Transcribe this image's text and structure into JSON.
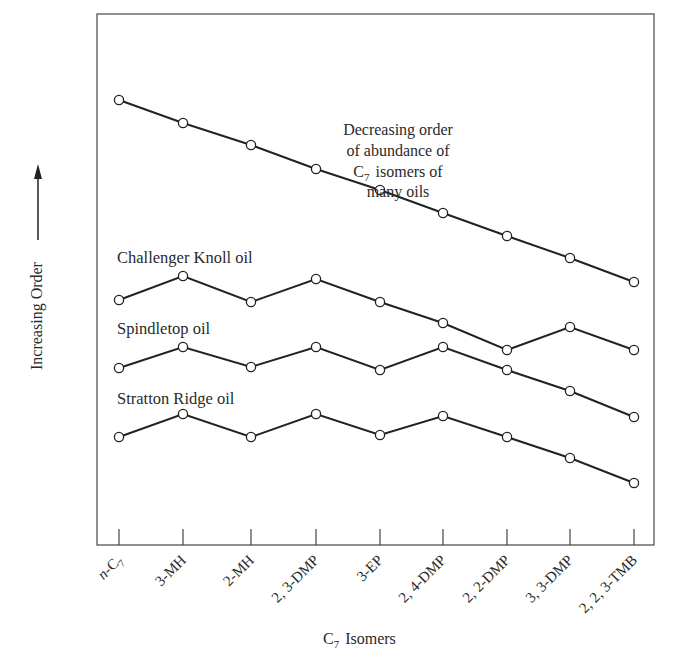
{
  "chart_data": {
    "type": "line",
    "title": "",
    "xlabel": "C7 Isomers",
    "xlabel_main": "C",
    "xlabel_sub": "7",
    "xlabel_rest": "Isomers",
    "ylabel": "Increasing Order",
    "ylabel_arrow": "up",
    "categories": [
      "n-C7",
      "3-MH",
      "2-MH",
      "2, 3-DMP",
      "3-EP",
      "2, 4-DMP",
      "2, 2-DMP",
      "3, 3-DMP",
      "2, 2, 3-TMB"
    ],
    "category_labels": [
      {
        "italic_prefix": "n",
        "text": "-C",
        "sub": "7"
      },
      {
        "italic_prefix": "",
        "text": "3-MH",
        "sub": ""
      },
      {
        "italic_prefix": "",
        "text": "2-MH",
        "sub": ""
      },
      {
        "italic_prefix": "",
        "text": "2, 3-DMP",
        "sub": ""
      },
      {
        "italic_prefix": "",
        "text": "3-EP",
        "sub": ""
      },
      {
        "italic_prefix": "",
        "text": "2, 4-DMP",
        "sub": ""
      },
      {
        "italic_prefix": "",
        "text": "2, 2-DMP",
        "sub": ""
      },
      {
        "italic_prefix": "",
        "text": "3, 3-DMP",
        "sub": ""
      },
      {
        "italic_prefix": "",
        "text": "2, 2, 3-TMB",
        "sub": ""
      }
    ],
    "y_ticks": [],
    "y_units": "relative order (no numeric scale shown); values are relative heights, higher = more abundant",
    "grid": false,
    "legend": "none (series labeled inline)",
    "series": [
      {
        "name": "Decreasing order of abundance of C7 isomers of many oils",
        "values": [
          100,
          91.2,
          82.8,
          73.6,
          65.5,
          56.7,
          47.9,
          39.5,
          30.3
        ]
      },
      {
        "name": "Challenger Knoll oil",
        "values": [
          23.4,
          32.6,
          22.6,
          31.8,
          22.6,
          14.6,
          4.2,
          13.0,
          4.2
        ]
      },
      {
        "name": "Spindletop oil",
        "values": -1
      },
      {
        "name": "Stratton Ridge oil",
        "values": -1
      }
    ]
  },
  "plot": {
    "frame": {
      "left": 97,
      "top": 14,
      "right": 654,
      "bottom": 545
    },
    "tick_x": [
      119,
      183,
      251,
      316,
      380,
      443,
      507,
      570,
      634
    ],
    "tick_height": 16,
    "series_pixels": [
      {
        "name": "decreasing-order",
        "y": [
          100,
          123,
          145,
          169,
          190,
          213,
          236,
          258,
          282
        ]
      },
      {
        "name": "challenger-knoll",
        "y": [
          300,
          276,
          302,
          279,
          302,
          323,
          350,
          327,
          350
        ]
      },
      {
        "name": "spindletop",
        "y": [
          368,
          347,
          367,
          347,
          370,
          347,
          370,
          391,
          417
        ]
      },
      {
        "name": "stratton-ridge",
        "y": [
          437,
          414,
          437,
          414,
          435,
          416,
          437,
          458,
          483
        ]
      }
    ]
  },
  "annotations": {
    "top_series": {
      "lines": [
        "Decreasing order",
        "of abundance of",
        "isomers of",
        "many oils"
      ],
      "c_main": "C",
      "c_sub": "7"
    },
    "challenger": "Challenger Knoll oil",
    "spindletop": "Spindletop oil",
    "stratton": "Stratton Ridge oil"
  },
  "colors": {
    "line": "#222222",
    "frame": "#444444",
    "text": "#2a2a2a",
    "marker_fill": "#ffffff",
    "background": "#ffffff"
  }
}
